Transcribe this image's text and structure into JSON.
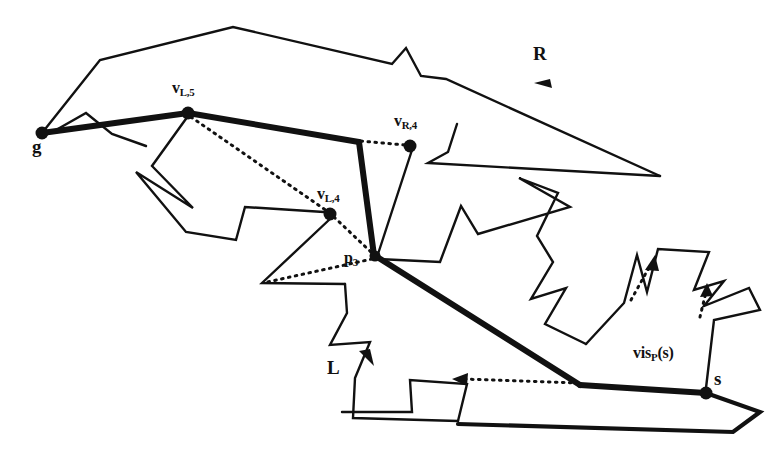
{
  "figure": {
    "background_color": "#ffffff",
    "ink_color": "#111111",
    "labels": [
      {
        "id": "label-g",
        "text": "g",
        "sub": "",
        "x": 34,
        "y": 143,
        "size": "big"
      },
      {
        "id": "label-vL5",
        "text": "v",
        "sub": "L,5",
        "x": 172,
        "y": 83,
        "size": "mid"
      },
      {
        "id": "label-vR4",
        "text": "v",
        "sub": "R,4",
        "x": 395,
        "y": 116,
        "size": "mid"
      },
      {
        "id": "label-vL4",
        "text": "v",
        "sub": "L,4",
        "x": 318,
        "y": 190,
        "size": "mid"
      },
      {
        "id": "label-p3",
        "text": "p",
        "sub": "3",
        "x": 345,
        "y": 254,
        "size": "mid"
      },
      {
        "id": "label-R",
        "text": "R",
        "sub": "",
        "x": 533,
        "y": 48,
        "size": "big"
      },
      {
        "id": "label-L",
        "text": "L",
        "sub": "",
        "x": 327,
        "y": 362,
        "size": "big"
      },
      {
        "id": "label-s",
        "text": "s",
        "sub": "",
        "x": 714,
        "y": 372,
        "size": "big"
      },
      {
        "id": "label-visPs",
        "text": "vis",
        "sub": "P",
        "x": 633,
        "y": 348,
        "size": "mid",
        "suffix": "(s)"
      }
    ],
    "marked_vertices": [
      {
        "id": "vertex-g",
        "name": "g",
        "x": 42,
        "y": 133,
        "r": 6
      },
      {
        "id": "vertex-vL5",
        "name": "v_L,5",
        "x": 188,
        "y": 113,
        "r": 6
      },
      {
        "id": "vertex-vR4",
        "name": "v_R,4",
        "x": 410,
        "y": 145,
        "r": 6
      },
      {
        "id": "vertex-vL4",
        "name": "v_L,4",
        "x": 330,
        "y": 214,
        "r": 6
      },
      {
        "id": "vertex-p3",
        "name": "p_3",
        "x": 374,
        "y": 255,
        "r": 5
      },
      {
        "id": "vertex-s",
        "name": "s",
        "x": 706,
        "y": 393,
        "r": 6
      }
    ],
    "polygon_outline": "M 42,133 L 100,60 L 233,27 L 393,63 L 405,49 L 420,74 L 445,77 L 660,175 L 431,164 L 450,151 L 460,122 L 410,145 L 374,255 L 441,261 L 506,211 L 497,240 L 540,260 L 532,299 L 565,289 L 548,322 L 588,343 L 618,310 L 634,265 L 637,300 L 640,257 L 706,257 L 690,290 L 721,282 L 702,306 L 746,291 L 758,309 L 716,318 L 706,393 L 760,412 L 733,431 L 456,425 L 474,386 L 410,379 L 418,411 L 257,412 L 284,375 L 351,418 L 367,342 L 327,345 L 346,313 L 315,283 L 323,255 L 260,250 L 330,214 L 237,240 L 219,208 L 193,230 L 150,166 L 188,113 L 85,113 L 109,131 L 144,148 Z",
    "bold_path": [
      {
        "from": "g",
        "to": "v_L,5",
        "points": "42,133 188,113"
      },
      {
        "from": "v_L,5",
        "to": "corner",
        "points": "188,113 358,142"
      },
      {
        "from": "corner",
        "to": "p_3",
        "points": "358,142 374,255"
      },
      {
        "from": "p_3",
        "to": "bend",
        "points": "374,255 580,385"
      },
      {
        "from": "bend",
        "to": "s",
        "points": "580,385 706,393"
      }
    ],
    "dotted_segments": [
      {
        "id": "dotted-vL5-vL4",
        "points": "188,113 330,214"
      },
      {
        "id": "dotted-vL4-p3",
        "points": "330,214 374,255"
      },
      {
        "id": "dotted-vR4-corner",
        "points": "358,142 410,145"
      },
      {
        "id": "dotted-p3-left",
        "points": "374,255 262,283"
      },
      {
        "id": "dotted-arrow-low",
        "points": "580,385 452,380"
      },
      {
        "id": "dotted-arrow-up1",
        "points": "628,307 648,262"
      },
      {
        "id": "dotted-arrow-up2",
        "points": "700,318 706,288"
      }
    ],
    "direction_arrows": [
      {
        "id": "arrow-R",
        "on": "upper-boundary",
        "x": 546,
        "y": 85,
        "dir": "left"
      },
      {
        "id": "arrow-L",
        "on": "lower-boundary",
        "x": 368,
        "y": 357,
        "dir": "down-right"
      }
    ]
  }
}
